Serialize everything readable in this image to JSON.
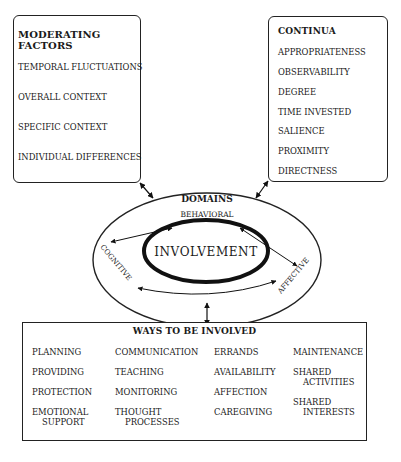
{
  "moderating_factors": {
    "title": "MODERATING FACTORS",
    "items": [
      "TEMPORAL FLUCTUATIONS",
      "OVERALL CONTEXT",
      "SPECIFIC CONTEXT",
      "INDIVIDUAL DIFFERENCES"
    ]
  },
  "continua": {
    "title": "CONTINUA",
    "items": [
      "APPROPRIATENESS",
      "OBSERVABILITY",
      "DEGREE",
      "TIME INVESTED",
      "SALIENCE",
      "PROXIMITY",
      "DIRECTNESS"
    ]
  },
  "domains": {
    "title": "DOMAINS",
    "behavioral": "BEHAVIORAL",
    "cognitive": "COGNITIVE",
    "affective": "AFFECTIVE",
    "center": "INVOLVEMENT"
  },
  "ways": {
    "title": "WAYS TO BE INVOLVED",
    "columns": [
      [
        "PLANNING",
        "PROVIDING",
        "PROTECTION",
        [
          "EMOTIONAL",
          "SUPPORT"
        ]
      ],
      [
        "COMMUNICATION",
        "TEACHING",
        "MONITORING",
        [
          "THOUGHT",
          "PROCESSES"
        ]
      ],
      [
        "ERRANDS",
        "AVAILABILITY",
        "AFFECTION",
        "CAREGIVING"
      ],
      [
        "MAINTENANCE",
        [
          "SHARED",
          "ACTIVITIES"
        ],
        [
          "SHARED",
          "INTERESTS"
        ]
      ]
    ]
  }
}
